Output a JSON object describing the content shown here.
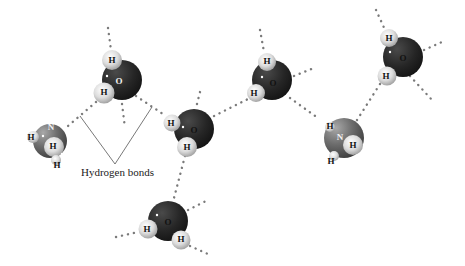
{
  "figure": {
    "caption": "Hydrogen bonds",
    "colors": {
      "oxygen": "#2a2a2a",
      "nitrogen": "#6a6a6a",
      "hydrogen": "#e6e6e6",
      "bond_dots": "#7a7a7a",
      "pointer_line": "#555555"
    }
  },
  "molecules": [
    {
      "id": "water-1",
      "type": "H2O",
      "center_label": "O",
      "h_labels": [
        "H",
        "H"
      ]
    },
    {
      "id": "ammonia-1",
      "type": "NH3",
      "center_label": "N",
      "h_labels": [
        "H",
        "H",
        "H"
      ]
    },
    {
      "id": "water-2",
      "type": "H2O",
      "center_label": "O",
      "h_labels": [
        "H",
        "H"
      ]
    },
    {
      "id": "water-3",
      "type": "H2O",
      "center_label": "O",
      "h_labels": [
        "H",
        "H"
      ]
    },
    {
      "id": "water-4",
      "type": "H2O",
      "center_label": "O",
      "h_labels": [
        "H",
        "H"
      ]
    },
    {
      "id": "ammonia-2",
      "type": "NH3",
      "center_label": "N",
      "h_labels": [
        "H",
        "H",
        "H"
      ]
    },
    {
      "id": "water-5",
      "type": "H2O",
      "center_label": "O",
      "h_labels": [
        "H",
        "H"
      ]
    }
  ]
}
